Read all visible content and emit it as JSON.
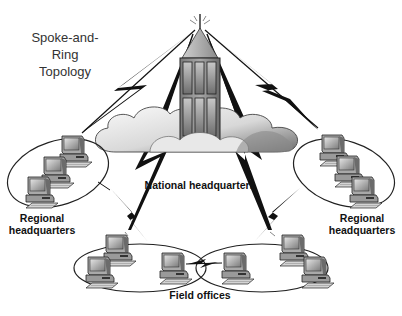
{
  "title": {
    "line1": "Spoke-and-Ring",
    "line2": "Topology"
  },
  "nodes": {
    "national": {
      "label": "National headquarters",
      "icon": "office-tower-icon"
    },
    "regional_left": {
      "label_line1": "Regional",
      "label_line2": "headquarters",
      "icon": "computer-ring-icon",
      "computers": 3
    },
    "regional_right": {
      "label_line1": "Regional",
      "label_line2": "headquarters",
      "icon": "computer-ring-icon",
      "computers": 3
    },
    "field": {
      "label": "Field offices",
      "icon": "computer-ring-icon",
      "rings": 2,
      "computers_per_ring": 3
    }
  },
  "links": [
    {
      "from": "national",
      "to": "regional_left",
      "style": "lightning"
    },
    {
      "from": "national",
      "to": "regional_right",
      "style": "lightning"
    },
    {
      "from": "national",
      "to": "field_left",
      "style": "lightning"
    },
    {
      "from": "national",
      "to": "field_right",
      "style": "lightning"
    },
    {
      "from": "regional_left",
      "to": "field_left",
      "style": "lightning"
    },
    {
      "from": "regional_right",
      "to": "field_right",
      "style": "lightning"
    },
    {
      "from": "field_left",
      "to": "field_right",
      "style": "lightning"
    }
  ],
  "colors": {
    "ink": "#111111",
    "cloud_light": "#f2f2f2",
    "cloud_dark": "#8a8a8a",
    "building": "#9a9a9a",
    "ring": "#222222"
  }
}
